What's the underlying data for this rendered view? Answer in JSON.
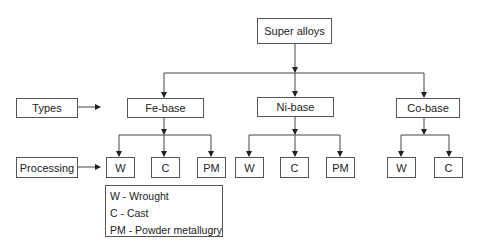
{
  "root": {
    "label": "Super alloys"
  },
  "row_labels": {
    "types": "Types",
    "processing": "Processing"
  },
  "types": [
    {
      "label": "Fe-base",
      "processes": [
        "W",
        "C",
        "PM"
      ]
    },
    {
      "label": "Ni-base",
      "processes": [
        "W",
        "C",
        "PM"
      ]
    },
    {
      "label": "Co-base",
      "processes": [
        "W",
        "C"
      ]
    }
  ],
  "legend": [
    "W - Wrought",
    "C - Cast",
    "PM - Powder metallugry"
  ]
}
